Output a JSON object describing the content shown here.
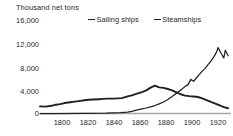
{
  "chart_data": {
    "type": "line",
    "title": "Thousand net tons",
    "xlabel": "",
    "ylabel": "Thousand net tons",
    "xlim": [
      1789,
      1922
    ],
    "ylim": [
      0,
      16000
    ],
    "grid": false,
    "legend_position": "top",
    "y_ticks": [
      "16,000",
      "12,000",
      "8,000",
      "4,000",
      "0"
    ],
    "y_tick_values": [
      16000,
      12000,
      8000,
      4000,
      0
    ],
    "x_ticks": [
      "1800",
      "1820",
      "1840",
      "1860",
      "1880",
      "1900",
      "1920"
    ],
    "x_tick_values": [
      1800,
      1820,
      1840,
      1860,
      1880,
      1900,
      1920
    ],
    "series": [
      {
        "name": "Sailing ships",
        "color": "#231f20",
        "x": [
          1789,
          1793,
          1797,
          1800,
          1803,
          1806,
          1810,
          1813,
          1816,
          1820,
          1823,
          1826,
          1830,
          1833,
          1836,
          1840,
          1843,
          1846,
          1850,
          1853,
          1856,
          1860,
          1863,
          1866,
          1869,
          1872,
          1875,
          1878,
          1881,
          1884,
          1887,
          1890,
          1893,
          1896,
          1899,
          1902,
          1905,
          1908,
          1911,
          1914,
          1917,
          1920
        ],
        "values": [
          1300,
          1250,
          1400,
          1600,
          1700,
          1900,
          2050,
          2150,
          2250,
          2400,
          2500,
          2550,
          2600,
          2650,
          2700,
          2700,
          2750,
          2800,
          3100,
          3300,
          3550,
          3900,
          4200,
          4700,
          5050,
          4750,
          4650,
          4450,
          4200,
          3850,
          3500,
          3250,
          3150,
          3100,
          3000,
          2750,
          2450,
          2100,
          1800,
          1500,
          1150,
          950
        ]
      },
      {
        "name": "Steamships",
        "color": "#231f20",
        "x": [
          1789,
          1800,
          1820,
          1835,
          1845,
          1850,
          1853,
          1856,
          1860,
          1863,
          1866,
          1869,
          1872,
          1875,
          1878,
          1881,
          1884,
          1887,
          1890,
          1892,
          1894,
          1896,
          1898,
          1900,
          1902,
          1904,
          1906,
          1908,
          1910,
          1912,
          1913,
          1915,
          1917,
          1918,
          1920
        ],
        "values": [
          0,
          0,
          20,
          60,
          150,
          250,
          400,
          600,
          850,
          1000,
          1200,
          1450,
          1750,
          2100,
          2550,
          3100,
          3700,
          4250,
          4900,
          5200,
          6200,
          5850,
          6500,
          7100,
          7700,
          8200,
          8900,
          9500,
          10300,
          11200,
          12000,
          11000,
          10100,
          11500,
          10500
        ]
      }
    ]
  }
}
